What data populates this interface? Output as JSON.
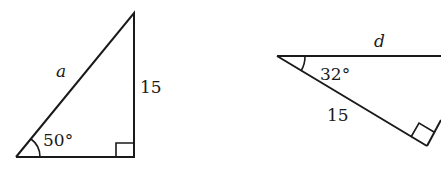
{
  "triangle_left": {
    "hypotenuse_label": "a",
    "opposite_side_label": "15",
    "angle_label": "50°",
    "right_angle": true
  },
  "triangle_right": {
    "top_side_label": "d",
    "hypotenuse_label": "15",
    "angle_label": "32°",
    "right_angle": true
  },
  "colors": {
    "stroke": "#1a1a1a",
    "background": "#ffffff"
  }
}
